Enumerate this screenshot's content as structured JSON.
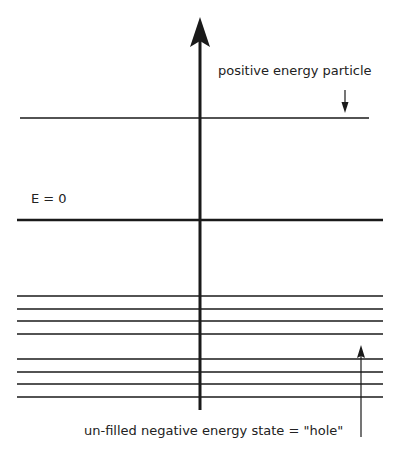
{
  "diagram": {
    "labels": {
      "positive_particle": "positive energy particle",
      "zero_energy": "E = 0",
      "hole": "un-filled negative energy state = \"hole\""
    },
    "axis": {
      "x": 200,
      "top": 17,
      "bottom": 410
    },
    "levels": {
      "positive": [
        {
          "y": 118,
          "x1": 20,
          "x2": 369
        }
      ],
      "zero": {
        "y": 220,
        "x1": 17,
        "x2": 383
      },
      "negative": [
        {
          "y": 296,
          "filled": true
        },
        {
          "y": 309,
          "filled": true
        },
        {
          "y": 321,
          "filled": true
        },
        {
          "y": 334,
          "filled": true
        },
        {
          "y": 346,
          "filled": false
        },
        {
          "y": 359,
          "filled": true
        },
        {
          "y": 372,
          "filled": true
        },
        {
          "y": 384,
          "filled": true
        },
        {
          "y": 397,
          "filled": true
        }
      ]
    },
    "colors": {
      "line": "#1a1a1a",
      "background": "#ffffff"
    }
  }
}
